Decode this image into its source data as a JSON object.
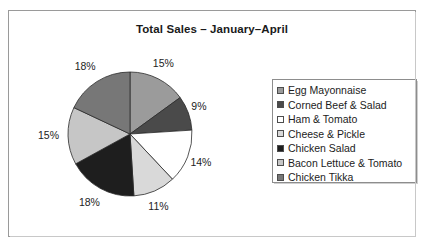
{
  "chart_data": {
    "type": "pie",
    "title": "Total Sales – January–April",
    "categories": [
      "Egg Mayonnaise",
      "Corned Beef & Salad",
      "Ham & Tomato",
      "Cheese & Pickle",
      "Chicken Salad",
      "Bacon Lettuce & Tomato",
      "Chicken Tikka"
    ],
    "values": [
      15,
      9,
      14,
      11,
      18,
      15,
      18
    ],
    "labels": [
      "15%",
      "9%",
      "14%",
      "11%",
      "18%",
      "15%",
      "18%"
    ],
    "colors": [
      "#9b9b9b",
      "#4a4a4a",
      "#ffffff",
      "#d9d9d9",
      "#1e1e1e",
      "#c6c6c6",
      "#777777"
    ],
    "legend_position": "right",
    "grid": false,
    "xlabel": "",
    "ylabel": ""
  },
  "legend": {
    "items": [
      {
        "label": "Egg Mayonnaise",
        "color": "#9b9b9b"
      },
      {
        "label": "Corned Beef & Salad",
        "color": "#4a4a4a"
      },
      {
        "label": "Ham & Tomato",
        "color": "#ffffff"
      },
      {
        "label": "Cheese & Pickle",
        "color": "#d9d9d9"
      },
      {
        "label": "Chicken Salad",
        "color": "#1e1e1e"
      },
      {
        "label": "Bacon Lettuce & Tomato",
        "color": "#c6c6c6"
      },
      {
        "label": "Chicken Tikka",
        "color": "#777777"
      }
    ]
  }
}
